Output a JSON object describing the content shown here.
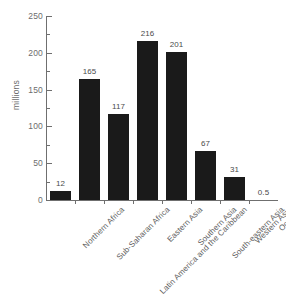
{
  "chart_data": {
    "type": "bar",
    "title": "",
    "xlabel": "",
    "ylabel": "millions",
    "ylim": [
      0,
      250
    ],
    "ytick_labels": [
      "0",
      "50",
      "100",
      "150",
      "200",
      "250"
    ],
    "ytick_values": [
      0,
      50,
      100,
      150,
      200,
      250
    ],
    "yminor_values": [
      25,
      75,
      125,
      175,
      225
    ],
    "grid": false,
    "legend": false,
    "bar_color": "#1a1a1a",
    "axis_color": "#6f6f6f",
    "text_color": "#5d5d5d",
    "categories": [
      "Northern Africa",
      "Sub-Saharan Africa",
      "Latin America and the Caribbean",
      "Eastern Asia",
      "Southern Asia",
      "South-eastern Asia",
      "Western Asia",
      "Oceania"
    ],
    "values": [
      12,
      165,
      117,
      216,
      201,
      67,
      31,
      0.5
    ],
    "value_labels": [
      "12",
      "165",
      "117",
      "216",
      "201",
      "67",
      "31",
      "0.5"
    ]
  }
}
